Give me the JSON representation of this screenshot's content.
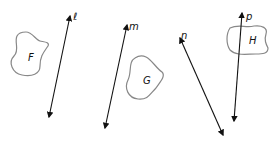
{
  "figure": {
    "lines": [
      {
        "label": "ℓ",
        "name": "line-l"
      },
      {
        "label": "m",
        "name": "line-m"
      },
      {
        "label": "n",
        "name": "line-n"
      },
      {
        "label": "p",
        "name": "line-p"
      }
    ],
    "shapes": [
      {
        "label": "F",
        "name": "shape-f"
      },
      {
        "label": "G",
        "name": "shape-g"
      },
      {
        "label": "H",
        "name": "shape-h"
      }
    ],
    "colors": {
      "line": "#111111",
      "shape_outline": "#888888"
    }
  }
}
